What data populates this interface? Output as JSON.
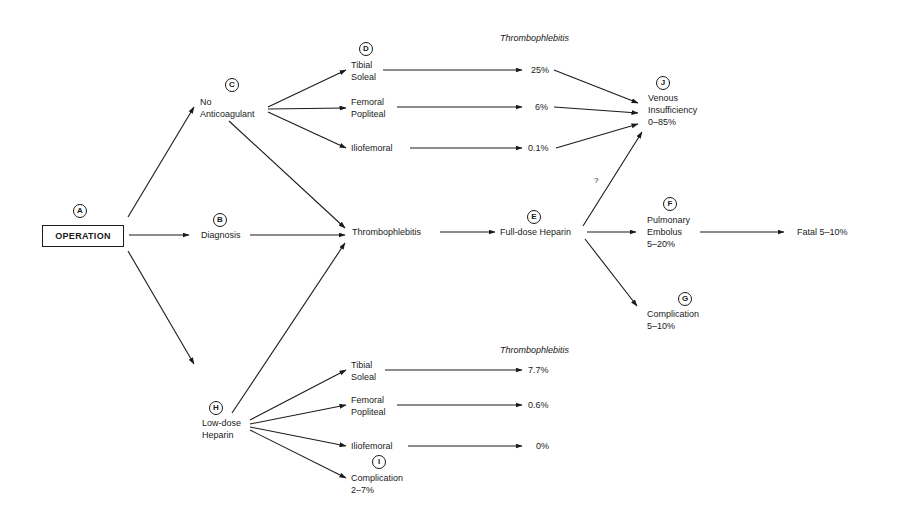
{
  "diagram": {
    "type": "flowchart",
    "nodes": {
      "A": {
        "marker": "A",
        "label": "OPERATION"
      },
      "B": {
        "marker": "B",
        "label": "Diagnosis"
      },
      "C": {
        "marker": "C",
        "lines": [
          "No",
          "Anticoagulant"
        ]
      },
      "D": {
        "marker": "D"
      },
      "E": {
        "marker": "E",
        "label": "Full-dose Heparin"
      },
      "F": {
        "marker": "F",
        "lines": [
          "Pulmonary",
          "Embolus",
          "5–20%"
        ]
      },
      "G": {
        "marker": "G",
        "lines": [
          "Complication",
          "5–10%"
        ]
      },
      "H": {
        "marker": "H",
        "lines": [
          "Low-dose",
          "Heparin"
        ]
      },
      "I": {
        "marker": "I",
        "lines": [
          "Complication",
          "2–7%"
        ]
      },
      "J": {
        "marker": "J",
        "lines": [
          "Venous",
          "Insufficiency",
          "0–85%"
        ]
      },
      "thrombophlebitis": {
        "label": "Thrombophlebitis"
      },
      "fatal": {
        "label": "Fatal 5–10%"
      },
      "question": {
        "label": "?"
      }
    },
    "upper_branch": {
      "header": "Thrombophlebitis",
      "sites": [
        {
          "lines": [
            "Tibial",
            "Soleal"
          ],
          "rate": "25%"
        },
        {
          "lines": [
            "Femoral",
            "Popliteal"
          ],
          "rate": "6%"
        },
        {
          "lines": [
            "Iliofemoral"
          ],
          "rate": "0.1%"
        }
      ]
    },
    "lower_branch": {
      "header": "Thrombophlebitis",
      "sites": [
        {
          "lines": [
            "Tibial",
            "Soleal"
          ],
          "rate": "7.7%"
        },
        {
          "lines": [
            "Femoral",
            "Popliteal"
          ],
          "rate": "0.6%"
        },
        {
          "lines": [
            "Iliofemoral"
          ],
          "rate": "0%"
        }
      ]
    },
    "edges": [
      [
        "A",
        "C"
      ],
      [
        "A",
        "B"
      ],
      [
        "A",
        "H"
      ],
      [
        "C",
        "upper.tibial"
      ],
      [
        "C",
        "upper.femoral"
      ],
      [
        "C",
        "upper.iliofemoral"
      ],
      [
        "C",
        "thrombophlebitis"
      ],
      [
        "B",
        "thrombophlebitis"
      ],
      [
        "H",
        "thrombophlebitis"
      ],
      [
        "upper.tibial",
        "25%"
      ],
      [
        "upper.femoral",
        "6%"
      ],
      [
        "upper.iliofemoral",
        "0.1%"
      ],
      [
        "25%",
        "J"
      ],
      [
        "6%",
        "J"
      ],
      [
        "0.1%",
        "J"
      ],
      [
        "thrombophlebitis",
        "E"
      ],
      [
        "E",
        "J"
      ],
      [
        "E",
        "F"
      ],
      [
        "E",
        "G"
      ],
      [
        "F",
        "fatal"
      ],
      [
        "H",
        "lower.tibial"
      ],
      [
        "H",
        "lower.femoral"
      ],
      [
        "H",
        "lower.iliofemoral"
      ],
      [
        "H",
        "I"
      ],
      [
        "lower.tibial",
        "7.7%"
      ],
      [
        "lower.femoral",
        "0.6%"
      ],
      [
        "lower.iliofemoral",
        "0%"
      ]
    ]
  }
}
